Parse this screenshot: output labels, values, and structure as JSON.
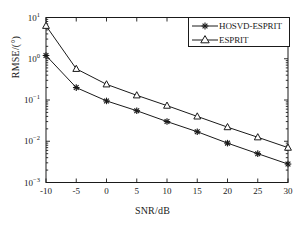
{
  "chart_data": {
    "type": "line",
    "title": "",
    "subtitle": "",
    "xlabel": "SNR/dB",
    "ylabel": "RMSE/(°)",
    "xscale": "linear",
    "yscale": "log",
    "xlim": [
      -10,
      30
    ],
    "ylim": [
      0.001,
      10
    ],
    "grid": false,
    "legend_position": "top-right",
    "x": [
      -10,
      -5,
      0,
      5,
      10,
      15,
      20,
      25,
      30
    ],
    "xtick_labels": [
      "-10",
      "-5",
      "0",
      "5",
      "10",
      "15",
      "20",
      "25",
      "30"
    ],
    "ytick_values": [
      10,
      1,
      0.1,
      0.01,
      0.001
    ],
    "ytick_labels": [
      {
        "base": "10",
        "exp": "1"
      },
      {
        "base": "10",
        "exp": "0"
      },
      {
        "base": "10",
        "exp": "-1"
      },
      {
        "base": "10",
        "exp": "-2"
      },
      {
        "base": "10",
        "exp": "-3"
      }
    ],
    "series": [
      {
        "name": "HOSVD-ESPRIT",
        "marker": "star",
        "color": "#1a1a1a",
        "values": [
          1.2,
          0.2,
          0.095,
          0.055,
          0.03,
          0.017,
          0.009,
          0.005,
          0.0028
        ]
      },
      {
        "name": "ESPRIT",
        "marker": "triangle",
        "color": "#1a1a1a",
        "values": [
          6.3,
          0.57,
          0.24,
          0.13,
          0.073,
          0.04,
          0.022,
          0.0125,
          0.007
        ]
      }
    ]
  },
  "legend": {
    "entries": [
      {
        "label": "HOSVD-ESPRIT",
        "marker": "star"
      },
      {
        "label": "ESPRIT",
        "marker": "triangle"
      }
    ]
  },
  "axes": {
    "x_axis_label": "SNR/dB",
    "y_axis_label": "RMSE/(°)"
  }
}
